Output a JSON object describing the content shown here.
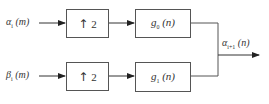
{
  "diagram": {
    "type": "block-diagram",
    "inputs": [
      {
        "id": "in-alpha",
        "symbol": "α",
        "subscript": "i",
        "arg": "(m)"
      },
      {
        "id": "in-beta",
        "symbol": "β",
        "subscript": "i",
        "arg": "(m)"
      }
    ],
    "upsamplers": [
      {
        "id": "up-top",
        "arrow": "↑",
        "factor": "2"
      },
      {
        "id": "up-bottom",
        "arrow": "↑",
        "factor": "2"
      }
    ],
    "filters": [
      {
        "id": "filter-g0",
        "symbol": "g",
        "subscript": "0",
        "arg": "(n)"
      },
      {
        "id": "filter-g1",
        "symbol": "g",
        "subscript": "1",
        "arg": "(n)"
      }
    ],
    "output": {
      "symbol": "α",
      "subscript": "i+1",
      "arg": "(n)"
    },
    "colors": {
      "line": "#333333",
      "box_border": "#555555",
      "background": "#ffffff"
    }
  }
}
